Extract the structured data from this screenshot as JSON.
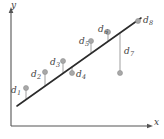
{
  "figure": {
    "width": 164,
    "height": 139,
    "background": "#ffffff"
  },
  "axes": {
    "x_label": "x",
    "y_label": "y",
    "x_label_pos": [
      154,
      118
    ],
    "y_label_pos": [
      11,
      1
    ],
    "origin": [
      11,
      126
    ],
    "x_end": [
      152,
      126
    ],
    "y_end": [
      11,
      8
    ],
    "axis_color": "#555555",
    "show_ticks": false,
    "show_grid": false
  },
  "chart_data": {
    "type": "scatter",
    "title": "",
    "xlabel": "x",
    "ylabel": "y",
    "grid": false,
    "legend": null,
    "fit_line": {
      "label": "",
      "color": "#2b2b2b",
      "x_start": 17,
      "y_start": 106,
      "x_end": 141,
      "y_end": 18
    },
    "point_color": "#a8a8a8",
    "stem_color": "#b5b5b5",
    "points": [
      {
        "label": "d",
        "sub": "1",
        "px": 26,
        "py": 88,
        "line_py": 99.6,
        "label_x": 11,
        "label_y": 86,
        "side": "left"
      },
      {
        "label": "d",
        "sub": "2",
        "px": 45,
        "py": 72,
        "line_py": 86.1,
        "label_x": 31,
        "label_y": 70,
        "side": "left"
      },
      {
        "label": "d",
        "sub": "3",
        "px": 63,
        "py": 61,
        "line_py": 73.4,
        "label_x": 50,
        "label_y": 58,
        "side": "left"
      },
      {
        "label": "d",
        "sub": "4",
        "px": 72,
        "py": 73,
        "line_py": 67.0,
        "label_x": 76,
        "label_y": 70,
        "side": "right"
      },
      {
        "label": "d",
        "sub": "5",
        "px": 91,
        "py": 41,
        "line_py": 53.5,
        "label_x": 79,
        "label_y": 37,
        "side": "left"
      },
      {
        "label": "d",
        "sub": "6",
        "px": 108,
        "py": 32,
        "line_py": 41.5,
        "label_x": 98,
        "label_y": 25,
        "side": "left"
      },
      {
        "label": "d",
        "sub": "7",
        "px": 120,
        "py": 73,
        "line_py": 33.0,
        "label_x": 124,
        "label_y": 47,
        "side": "right"
      },
      {
        "label": "d",
        "sub": "8",
        "px": 138,
        "py": 21,
        "line_py": 20.1,
        "label_x": 143,
        "label_y": 16,
        "side": "right"
      }
    ],
    "x": [
      26,
      45,
      63,
      72,
      91,
      108,
      120,
      138
    ],
    "y": [
      88,
      72,
      61,
      73,
      41,
      32,
      73,
      21
    ],
    "residual_labels": [
      "d1",
      "d2",
      "d3",
      "d4",
      "d5",
      "d6",
      "d7",
      "d8"
    ]
  }
}
